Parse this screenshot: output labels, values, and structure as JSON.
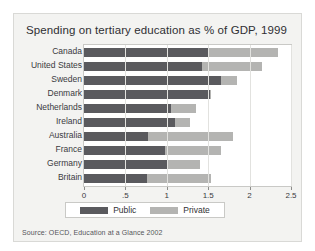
{
  "scan": {
    "clipped_header_text": "",
    "page_background": "#ffffff"
  },
  "figure": {
    "background": "#f3f3f1",
    "border_color": "#d9d9d6"
  },
  "source_note": "Source: OECD, Education at a Glance 2002",
  "legend": {
    "public_label": "Public",
    "private_label": "Private",
    "public_color": "#5a5a5e",
    "private_color": "#b4b4b2"
  },
  "chart_data": {
    "type": "bar",
    "orientation": "horizontal",
    "stacked": true,
    "title": "Spending on tertiary education as % of GDP, 1999",
    "xlabel": "",
    "ylabel": "",
    "xlim": [
      0,
      2.5
    ],
    "ylim": null,
    "grid": true,
    "legend_position": "bottom",
    "categories": [
      "Canada",
      "United States",
      "Sweden",
      "Denmark",
      "Netherlands",
      "Ireland",
      "Australia",
      "France",
      "Germany",
      "Britain"
    ],
    "xticks": [
      0,
      0.5,
      1,
      1.5,
      2,
      2.5
    ],
    "xticklabels": [
      "0",
      ".5",
      "1",
      "1.5",
      "2",
      "2.5"
    ],
    "series": [
      {
        "name": "Public",
        "color": "#5a5a5e",
        "values": [
          1.5,
          1.42,
          1.65,
          1.52,
          1.05,
          1.1,
          0.77,
          0.98,
          1.02,
          0.76
        ]
      },
      {
        "name": "Private",
        "color": "#b4b4b2",
        "values": [
          0.84,
          0.73,
          0.2,
          0.02,
          0.3,
          0.18,
          1.03,
          0.68,
          0.38,
          0.77
        ]
      }
    ],
    "totals": [
      2.34,
      2.15,
      1.85,
      1.54,
      1.35,
      1.28,
      1.8,
      1.66,
      1.4,
      1.53
    ]
  }
}
